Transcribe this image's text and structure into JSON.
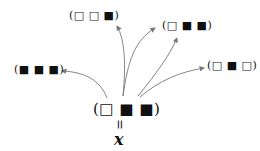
{
  "nodes": {
    "center": "(□ ■ ■)",
    "top_left": "(□ □ ■)",
    "top_right": "(□ ■ ■)",
    "left": "(■ ■ ■)",
    "right": "(□ ■ □)"
  },
  "equals_symbol": "=",
  "variable": "x",
  "colors": {
    "arrow": "#777777",
    "text": "#111111"
  }
}
